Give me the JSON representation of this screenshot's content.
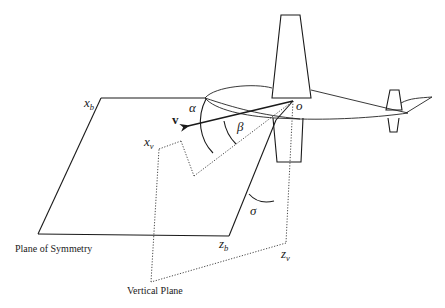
{
  "diagram": {
    "type": "aircraft-axes-geometry",
    "labels": {
      "plane_of_symmetry": "Plane of Symmetry",
      "vertical_plane": "Vertical Plane",
      "velocity": "v",
      "origin": "o",
      "alpha": "α",
      "beta": "β",
      "sigma": "σ",
      "x_b_main": "x",
      "x_b_sub": "b",
      "z_b_main": "z",
      "z_b_sub": "b",
      "x_v_main": "x",
      "x_v_sub": "v",
      "z_v_main": "z",
      "z_v_sub": "v"
    },
    "elements": [
      {
        "name": "plane-of-symmetry",
        "style": "solid"
      },
      {
        "name": "vertical-plane",
        "style": "dotted"
      },
      {
        "name": "velocity-vector",
        "style": "arrow"
      },
      {
        "name": "aircraft",
        "style": "outline"
      },
      {
        "name": "angle-alpha-arc",
        "style": "solid"
      },
      {
        "name": "angle-beta-arc",
        "style": "solid"
      },
      {
        "name": "angle-sigma-arc",
        "style": "solid"
      }
    ],
    "colors": {
      "line": "#1a1a1a",
      "background": "#ffffff"
    }
  }
}
